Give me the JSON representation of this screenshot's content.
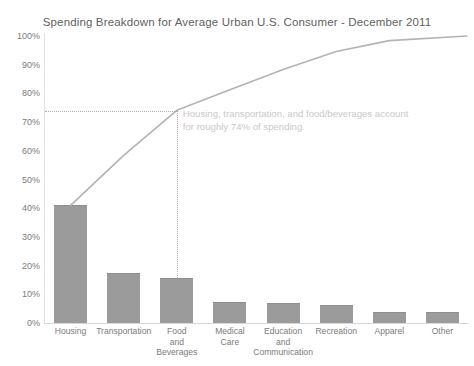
{
  "chart_data": {
    "type": "bar",
    "title": "Spending Breakdown for Average Urban U.S. Consumer - December 2011",
    "xlabel": "",
    "ylabel": "",
    "ylim": [
      0,
      100
    ],
    "grid": false,
    "legend": "none",
    "categories": [
      "Housing",
      "Transportation",
      "Food and Beverages",
      "Medical Care",
      "Education and Communication",
      "Recreation",
      "Apparel",
      "Other"
    ],
    "category_lines": [
      [
        "Housing"
      ],
      [
        "Transportation"
      ],
      [
        "Food",
        "and",
        "Beverages"
      ],
      [
        "Medical",
        "Care"
      ],
      [
        "Education",
        "and",
        "Communication"
      ],
      [
        "Recreation"
      ],
      [
        "Apparel"
      ],
      [
        "Other"
      ]
    ],
    "values": [
      41,
      17.4,
      15.7,
      7.2,
      7.0,
      6.3,
      3.8,
      3.8
    ],
    "series": [
      {
        "name": "Share of spending",
        "type": "bar",
        "values": [
          41,
          17.4,
          15.7,
          7.2,
          7.0,
          6.3,
          3.8,
          3.8
        ]
      },
      {
        "name": "Cumulative share",
        "type": "line",
        "values": [
          41,
          58.4,
          74.1,
          81.3,
          88.3,
          94.6,
          98.4,
          100
        ]
      }
    ],
    "ytick_labels": [
      "100%",
      "90%",
      "80%",
      "70%",
      "60%",
      "50%",
      "40%",
      "30%",
      "20%",
      "10%",
      "0%"
    ],
    "ytick_values": [
      100,
      90,
      80,
      70,
      60,
      50,
      40,
      30,
      20,
      10,
      0
    ],
    "annotations": [
      {
        "name": "cumulative-callout",
        "line1": "Housing, transportation, and food/beverages account",
        "line2": "for roughly 74% of spending.",
        "reference_value": 74
      }
    ],
    "colors": {
      "bar_fill": "#9b9b9b",
      "bar_edge": "#8e8e8e",
      "line": "#b3b3b3",
      "reference_dotted": "#b9a9a9",
      "annotation_text": "#c9c9c9",
      "axis": "#d8d8d8",
      "tick_text": "#7b7b7b",
      "title_text": "#5f5f5f",
      "background": "#ffffff"
    }
  }
}
